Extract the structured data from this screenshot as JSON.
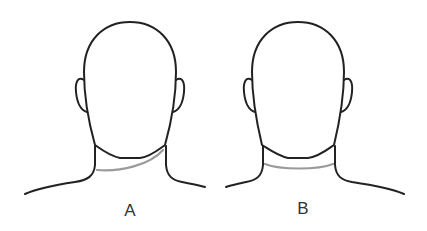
{
  "figures": [
    {
      "id": "A",
      "label": "A",
      "description": "Head from behind with diagonal neck line"
    },
    {
      "id": "B",
      "label": "B",
      "description": "Head from behind with horizontal neck line"
    }
  ],
  "colors": {
    "outline": "#222222",
    "neck_line": "#9a9a9a",
    "background": "#ffffff"
  }
}
